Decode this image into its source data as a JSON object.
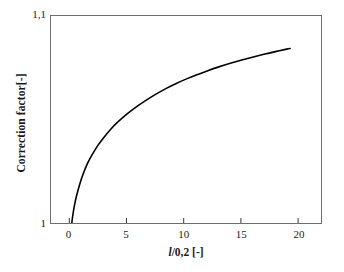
{
  "chart_data": {
    "type": "line",
    "title": "",
    "xlabel": "l/0,2 [-]",
    "xlabel_symbol": "l",
    "xlabel_rest": "/0,2 [-]",
    "ylabel": "Correction factor[-]",
    "xlim": [
      -1.6,
      22.0
    ],
    "ylim": [
      1.0,
      1.1
    ],
    "xticks": [
      0,
      5,
      10,
      15,
      20
    ],
    "xtick_labels": [
      "0",
      "5",
      "10",
      "15",
      "20"
    ],
    "yticks": [
      1.0,
      1.1
    ],
    "ytick_labels": [
      "1",
      "1,1"
    ],
    "grid": false,
    "legend": null,
    "series": [
      {
        "name": "correction factor",
        "color": "#000000",
        "line_width": 1.6,
        "x": [
          0.22,
          0.3,
          0.45,
          0.65,
          0.9,
          1.2,
          1.6,
          2.0,
          2.5,
          3.0,
          3.6,
          4.2,
          5.0,
          5.8,
          6.6,
          7.5,
          8.4,
          9.3,
          10.2,
          11.2,
          12.1,
          13.0,
          14.0,
          15.0,
          16.0,
          17.0,
          18.0,
          19.0,
          19.3
        ],
        "y": [
          1.0,
          1.0035,
          1.0085,
          1.0135,
          1.0185,
          1.0235,
          1.0289,
          1.033,
          1.0375,
          1.0412,
          1.0452,
          1.0486,
          1.0525,
          1.0559,
          1.0589,
          1.062,
          1.0648,
          1.0673,
          1.0695,
          1.0717,
          1.0736,
          1.0753,
          1.077,
          1.0786,
          1.0801,
          1.0815,
          1.0828,
          1.084,
          1.0843
        ]
      }
    ]
  },
  "axes": {
    "frame_color": "#6d6d6d",
    "tick_color": "#333333"
  }
}
